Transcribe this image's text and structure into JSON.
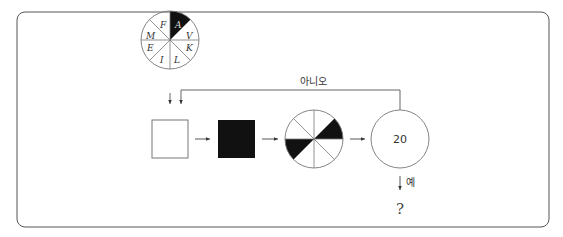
{
  "diagram": {
    "frame": {
      "stroke": "#555555"
    },
    "top_wheel": {
      "sectors": [
        {
          "label": "A",
          "filled": true
        },
        {
          "label": "V",
          "filled": false
        },
        {
          "label": "K",
          "filled": false
        },
        {
          "label": "L",
          "filled": false
        },
        {
          "label": "I",
          "filled": false
        },
        {
          "label": "E",
          "filled": false
        },
        {
          "label": "M",
          "filled": false
        },
        {
          "label": "F",
          "filled": false
        }
      ]
    },
    "feedback_label": "아니오",
    "stage_boxes": [
      {
        "fill": "white"
      },
      {
        "fill": "black"
      }
    ],
    "result_wheel": {
      "filled_sectors": [
        "right-upper (0°–45°)",
        "left-lower (180°–225°)"
      ]
    },
    "decision_circle": {
      "value": "20"
    },
    "yes_label": "예",
    "output_label": "?"
  }
}
